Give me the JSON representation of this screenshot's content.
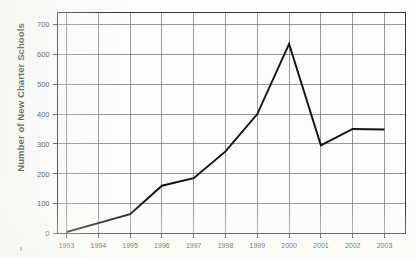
{
  "chart_data": {
    "type": "line",
    "title": "",
    "subtitle": "",
    "xlabel": "",
    "ylabel": "Number of New Charter Schools",
    "categories": [
      "1993",
      "1994",
      "1995",
      "1996",
      "1997",
      "1998",
      "1999",
      "2000",
      "2001",
      "2002",
      "2003"
    ],
    "x": [
      1993,
      1994,
      1995,
      1996,
      1997,
      1998,
      1999,
      2000,
      2001,
      2002,
      2003
    ],
    "values": [
      5,
      35,
      65,
      160,
      185,
      275,
      400,
      635,
      295,
      350,
      348
    ],
    "series": [
      {
        "name": "New Charter Schools",
        "values": [
          5,
          35,
          65,
          160,
          185,
          275,
          400,
          635,
          295,
          350,
          348
        ]
      }
    ],
    "ylim": [
      0,
      740
    ],
    "xlim": [
      1992.55,
      1993.55
    ],
    "yticks": [
      0,
      100,
      200,
      300,
      400,
      500,
      600,
      700
    ],
    "ytick_labels": [
      "0",
      "100",
      "200",
      "300",
      "400",
      "500",
      "600",
      "700"
    ],
    "xticks": [
      1993,
      1994,
      1995,
      1996,
      1997,
      1998,
      1999,
      2000,
      2001,
      2002,
      2003
    ],
    "xtick_labels": [
      "1993",
      "1994",
      "1995",
      "1996",
      "1997",
      "1998",
      "1999",
      "2000",
      "2001",
      "2002",
      "2003"
    ],
    "grid": true,
    "grid_axes": "both",
    "legend": false,
    "legend_position": "none",
    "line_color": "#111111",
    "grid_color": "#777777",
    "frame_color": "#333333",
    "background_color": "#fdfdfc",
    "annotations": []
  },
  "axis": {
    "ylabel": "Number of New Charter Schools"
  }
}
